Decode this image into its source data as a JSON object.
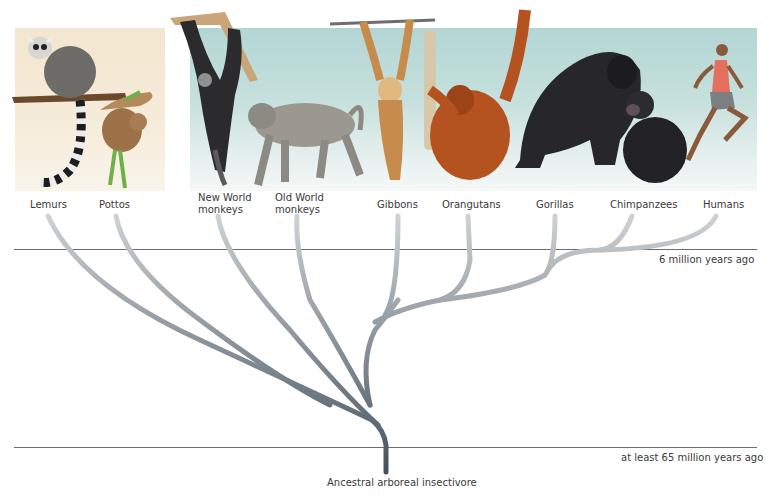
{
  "figure": {
    "type": "phylogenetic-tree",
    "root_label": "Ancestral arboreal insectivore",
    "time_markers": [
      {
        "label": "6 million years ago"
      },
      {
        "label": "at least 65 million years ago"
      }
    ],
    "taxa": [
      {
        "id": "lemurs",
        "label": "Lemurs"
      },
      {
        "id": "pottos",
        "label": "Pottos"
      },
      {
        "id": "new-world-monkeys",
        "label_line1": "New World",
        "label_line2": "monkeys"
      },
      {
        "id": "old-world-monkeys",
        "label_line1": "Old World",
        "label_line2": "monkeys"
      },
      {
        "id": "gibbons",
        "label": "Gibbons"
      },
      {
        "id": "orangutans",
        "label": "Orangutans"
      },
      {
        "id": "gorillas",
        "label": "Gorillas"
      },
      {
        "id": "chimpanzees",
        "label": "Chimpanzees"
      },
      {
        "id": "humans",
        "label": "Humans"
      }
    ],
    "panels": [
      {
        "name": "prosimian-panel",
        "color": "#f3e6cf"
      },
      {
        "name": "anthropoid-panel",
        "color": "#b3d6d4"
      }
    ],
    "colors": {
      "branch_dark": "#4e5d68",
      "branch_light": "#c5c8cc",
      "rule": "#6d6d6d"
    }
  }
}
